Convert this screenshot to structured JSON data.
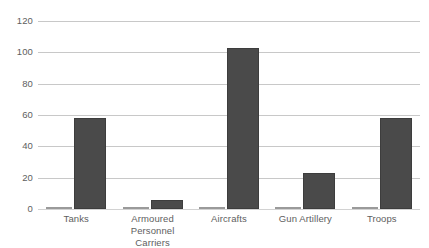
{
  "chart_data": {
    "type": "bar",
    "title": "",
    "subtitle": "",
    "xlabel": "",
    "ylabel": "",
    "ylim": [
      0,
      120
    ],
    "ytick_values": [
      0,
      20,
      40,
      60,
      80,
      100,
      120
    ],
    "ytick_labels": [
      "0",
      "20",
      "40",
      "60",
      "80",
      "100",
      "120"
    ],
    "grid": true,
    "legend": "none",
    "categories": [
      "Tanks",
      "Armoured Personnel Carriers",
      "Aircrafts",
      "Gun Artillery",
      "Troops"
    ],
    "category_label_lines": [
      [
        "Tanks"
      ],
      [
        "Armoured",
        "Personnel Carriers"
      ],
      [
        "Aircrafts"
      ],
      [
        "Gun Artillery"
      ],
      [
        "Troops"
      ]
    ],
    "series": [
      {
        "name": "Series 1",
        "color": "#585858",
        "values": [
          1,
          1,
          1,
          1,
          1
        ]
      },
      {
        "name": "Series 2",
        "color": "#4a4a4a",
        "values": [
          58,
          6,
          103,
          23,
          58
        ]
      }
    ]
  },
  "style": {
    "background_color": "#ffffff",
    "gridline_color": "#c8c8c8",
    "axis_text_color": "#5e5e5e",
    "bar_color_primary": "#4a4a4a",
    "bar_color_secondary": "#585858"
  }
}
